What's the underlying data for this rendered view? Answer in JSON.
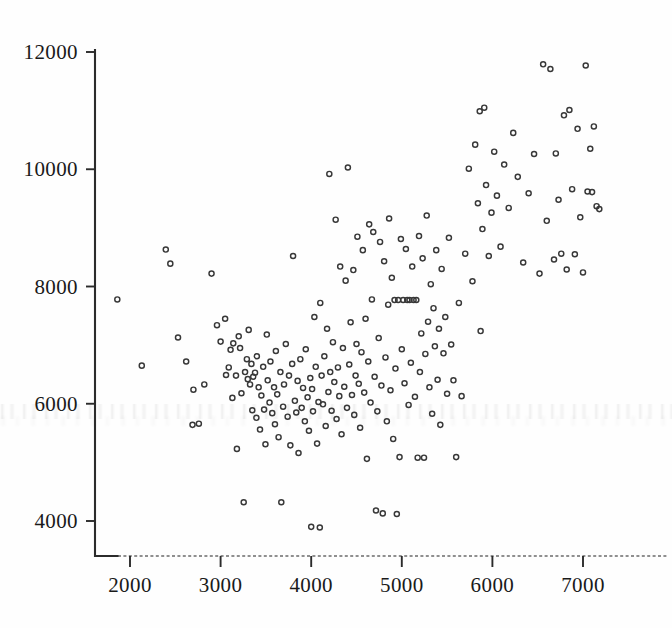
{
  "chart_data": {
    "type": "scatter",
    "title": "",
    "subtitle": "",
    "xlabel": "",
    "ylabel": "",
    "xlim": [
      1650,
      7500
    ],
    "ylim": [
      3550,
      12200
    ],
    "xticks": [
      2000,
      3000,
      4000,
      5000,
      6000,
      7000
    ],
    "yticks": [
      4000,
      6000,
      8000,
      10000,
      12000
    ],
    "xtick_labels": [
      "2000",
      "3000",
      "4000",
      "5000",
      "6000",
      "7000"
    ],
    "ytick_labels": [
      "4000",
      "6000",
      "8000",
      "10000",
      "12000"
    ],
    "grid": false,
    "legend": null,
    "marker": "open-circle",
    "marker_color": "#383838",
    "n_points": 232,
    "series": [
      {
        "name": "observations",
        "points": [
          [
            1860,
            7780
          ],
          [
            2130,
            6650
          ],
          [
            2395,
            8630
          ],
          [
            2445,
            8390
          ],
          [
            2530,
            7130
          ],
          [
            2620,
            6720
          ],
          [
            2690,
            5640
          ],
          [
            2700,
            6240
          ],
          [
            2760,
            5660
          ],
          [
            2820,
            6330
          ],
          [
            2900,
            8220
          ],
          [
            2960,
            7340
          ],
          [
            3000,
            7060
          ],
          [
            3050,
            7450
          ],
          [
            3060,
            6490
          ],
          [
            3090,
            6620
          ],
          [
            3110,
            6920
          ],
          [
            3130,
            6100
          ],
          [
            3140,
            7030
          ],
          [
            3170,
            6480
          ],
          [
            3180,
            5230
          ],
          [
            3200,
            7150
          ],
          [
            3215,
            6950
          ],
          [
            3230,
            6180
          ],
          [
            3255,
            4320
          ],
          [
            3270,
            6540
          ],
          [
            3290,
            6760
          ],
          [
            3300,
            6420
          ],
          [
            3310,
            7260
          ],
          [
            3325,
            6330
          ],
          [
            3340,
            6680
          ],
          [
            3350,
            5890
          ],
          [
            3360,
            6460
          ],
          [
            3380,
            6530
          ],
          [
            3395,
            5760
          ],
          [
            3400,
            6810
          ],
          [
            3420,
            6280
          ],
          [
            3435,
            5560
          ],
          [
            3450,
            6140
          ],
          [
            3470,
            6630
          ],
          [
            3480,
            5900
          ],
          [
            3495,
            5310
          ],
          [
            3510,
            7180
          ],
          [
            3520,
            6400
          ],
          [
            3540,
            6020
          ],
          [
            3550,
            6720
          ],
          [
            3570,
            5840
          ],
          [
            3590,
            6280
          ],
          [
            3600,
            5650
          ],
          [
            3610,
            6900
          ],
          [
            3625,
            6160
          ],
          [
            3640,
            5430
          ],
          [
            3660,
            6540
          ],
          [
            3670,
            4320
          ],
          [
            3690,
            5950
          ],
          [
            3700,
            6330
          ],
          [
            3720,
            7020
          ],
          [
            3740,
            5780
          ],
          [
            3755,
            6480
          ],
          [
            3770,
            5290
          ],
          [
            3790,
            6680
          ],
          [
            3800,
            8520
          ],
          [
            3820,
            6050
          ],
          [
            3835,
            5850
          ],
          [
            3850,
            6390
          ],
          [
            3860,
            5160
          ],
          [
            3880,
            6760
          ],
          [
            3895,
            5930
          ],
          [
            3910,
            6270
          ],
          [
            3930,
            5700
          ],
          [
            3940,
            6930
          ],
          [
            3960,
            6110
          ],
          [
            3975,
            5540
          ],
          [
            3990,
            6440
          ],
          [
            4000,
            3900
          ],
          [
            4010,
            6250
          ],
          [
            4020,
            5870
          ],
          [
            4035,
            7480
          ],
          [
            4050,
            6630
          ],
          [
            4065,
            5320
          ],
          [
            4080,
            6030
          ],
          [
            4095,
            3890
          ],
          [
            4100,
            7720
          ],
          [
            4115,
            6480
          ],
          [
            4130,
            5990
          ],
          [
            4145,
            6810
          ],
          [
            4160,
            5620
          ],
          [
            4175,
            7280
          ],
          [
            4190,
            6200
          ],
          [
            4200,
            9920
          ],
          [
            4210,
            6540
          ],
          [
            4225,
            5880
          ],
          [
            4240,
            7050
          ],
          [
            4255,
            6370
          ],
          [
            4270,
            9140
          ],
          [
            4280,
            5740
          ],
          [
            4295,
            6620
          ],
          [
            4310,
            6130
          ],
          [
            4320,
            8340
          ],
          [
            4335,
            5480
          ],
          [
            4350,
            6950
          ],
          [
            4365,
            6290
          ],
          [
            4380,
            8100
          ],
          [
            4395,
            5930
          ],
          [
            4405,
            10030
          ],
          [
            4420,
            6670
          ],
          [
            4435,
            7390
          ],
          [
            4450,
            6150
          ],
          [
            4465,
            8280
          ],
          [
            4475,
            5810
          ],
          [
            4490,
            6480
          ],
          [
            4500,
            7020
          ],
          [
            4510,
            8850
          ],
          [
            4525,
            6340
          ],
          [
            4540,
            5590
          ],
          [
            4555,
            6880
          ],
          [
            4570,
            8620
          ],
          [
            4585,
            6190
          ],
          [
            4600,
            7450
          ],
          [
            4615,
            5060
          ],
          [
            4630,
            6720
          ],
          [
            4640,
            9060
          ],
          [
            4655,
            6020
          ],
          [
            4670,
            7780
          ],
          [
            4685,
            8930
          ],
          [
            4700,
            6460
          ],
          [
            4715,
            4180
          ],
          [
            4730,
            5870
          ],
          [
            4745,
            7120
          ],
          [
            4760,
            8760
          ],
          [
            4775,
            6310
          ],
          [
            4790,
            4130
          ],
          [
            4805,
            8430
          ],
          [
            4820,
            6790
          ],
          [
            4835,
            5700
          ],
          [
            4850,
            7690
          ],
          [
            4860,
            9160
          ],
          [
            4875,
            6230
          ],
          [
            4890,
            8150
          ],
          [
            4905,
            5400
          ],
          [
            4920,
            7770
          ],
          [
            4930,
            6600
          ],
          [
            4945,
            4120
          ],
          [
            4960,
            7770
          ],
          [
            4975,
            5090
          ],
          [
            4990,
            8810
          ],
          [
            5000,
            6930
          ],
          [
            5015,
            7770
          ],
          [
            5030,
            6350
          ],
          [
            5045,
            8640
          ],
          [
            5060,
            7770
          ],
          [
            5075,
            5980
          ],
          [
            5085,
            7770
          ],
          [
            5100,
            6700
          ],
          [
            5115,
            8340
          ],
          [
            5130,
            7770
          ],
          [
            5145,
            6120
          ],
          [
            5160,
            7770
          ],
          [
            5175,
            5080
          ],
          [
            5190,
            8860
          ],
          [
            5200,
            6540
          ],
          [
            5215,
            7200
          ],
          [
            5230,
            8480
          ],
          [
            5245,
            5080
          ],
          [
            5260,
            6850
          ],
          [
            5275,
            9210
          ],
          [
            5290,
            7400
          ],
          [
            5305,
            6280
          ],
          [
            5320,
            8040
          ],
          [
            5335,
            5830
          ],
          [
            5350,
            7630
          ],
          [
            5365,
            6980
          ],
          [
            5380,
            8620
          ],
          [
            5395,
            6410
          ],
          [
            5410,
            7280
          ],
          [
            5425,
            5640
          ],
          [
            5440,
            8300
          ],
          [
            5460,
            6860
          ],
          [
            5480,
            7480
          ],
          [
            5500,
            6170
          ],
          [
            5520,
            8830
          ],
          [
            5545,
            7010
          ],
          [
            5570,
            6400
          ],
          [
            5600,
            5090
          ],
          [
            5630,
            7720
          ],
          [
            5660,
            6130
          ],
          [
            5700,
            8560
          ],
          [
            5740,
            10010
          ],
          [
            5780,
            8090
          ],
          [
            5810,
            10420
          ],
          [
            5840,
            9420
          ],
          [
            5860,
            10990
          ],
          [
            5870,
            7240
          ],
          [
            5890,
            8980
          ],
          [
            5910,
            11050
          ],
          [
            5930,
            9730
          ],
          [
            5960,
            8520
          ],
          [
            5990,
            9260
          ],
          [
            6020,
            10300
          ],
          [
            6050,
            9550
          ],
          [
            6090,
            8680
          ],
          [
            6130,
            10080
          ],
          [
            6180,
            9340
          ],
          [
            6230,
            10620
          ],
          [
            6280,
            9870
          ],
          [
            6340,
            8410
          ],
          [
            6400,
            9590
          ],
          [
            6460,
            10260
          ],
          [
            6520,
            8220
          ],
          [
            6560,
            11790
          ],
          [
            6600,
            9120
          ],
          [
            6640,
            11710
          ],
          [
            6680,
            8460
          ],
          [
            6700,
            10270
          ],
          [
            6730,
            9480
          ],
          [
            6760,
            8560
          ],
          [
            6790,
            10920
          ],
          [
            6820,
            8290
          ],
          [
            6850,
            11010
          ],
          [
            6880,
            9660
          ],
          [
            6910,
            8550
          ],
          [
            6940,
            10690
          ],
          [
            6970,
            9180
          ],
          [
            7000,
            8240
          ],
          [
            7030,
            11770
          ],
          [
            7050,
            9620
          ],
          [
            7080,
            10350
          ],
          [
            7100,
            9610
          ],
          [
            7120,
            10730
          ],
          [
            7150,
            9370
          ],
          [
            7180,
            9320
          ]
        ]
      }
    ]
  },
  "artifacts": {
    "bleed_through_note": "faint scanned reverse-page text",
    "bleed_rows_y": [
      408,
      418
    ]
  }
}
